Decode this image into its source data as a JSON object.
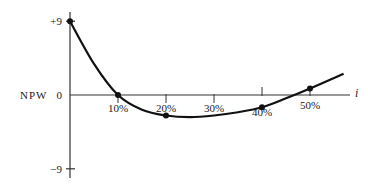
{
  "chart_data": {
    "type": "line",
    "title": "",
    "xlabel": "i",
    "ylabel": "NPW",
    "x_ticks": [
      "10%",
      "20%",
      "30%",
      "40%",
      "50%"
    ],
    "y_ticks": [
      "+9",
      "0",
      "-9"
    ],
    "xlim": [
      0,
      57
    ],
    "ylim": [
      -9,
      9
    ],
    "grid": false,
    "series": [
      {
        "name": "NPW vs i",
        "marked_points": [
          {
            "x": 0,
            "y": 9
          },
          {
            "x": 10,
            "y": 0
          },
          {
            "x": 20,
            "y": -2.5
          },
          {
            "x": 40,
            "y": -1.5
          },
          {
            "x": 50,
            "y": 0.8
          }
        ],
        "curve": [
          {
            "x": 0,
            "y": 9
          },
          {
            "x": 5,
            "y": 3.8
          },
          {
            "x": 10,
            "y": 0
          },
          {
            "x": 15,
            "y": -1.8
          },
          {
            "x": 20,
            "y": -2.5
          },
          {
            "x": 25,
            "y": -2.7
          },
          {
            "x": 30,
            "y": -2.5
          },
          {
            "x": 35,
            "y": -2.1
          },
          {
            "x": 40,
            "y": -1.5
          },
          {
            "x": 45,
            "y": -0.4
          },
          {
            "x": 50,
            "y": 0.8
          },
          {
            "x": 57,
            "y": 2.6
          }
        ]
      }
    ]
  }
}
